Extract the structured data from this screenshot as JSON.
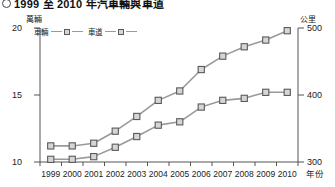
{
  "title": {
    "bullet": "circle-bullet",
    "text": "1999 至 2010 年汽車輛與車道"
  },
  "axes": {
    "left_unit": "萬輛",
    "right_unit": "公里",
    "x_title": "年份",
    "left_ticks": [
      "20",
      "15",
      "10"
    ],
    "right_ticks": [
      "500",
      "400",
      "300"
    ],
    "left_range": [
      10,
      20
    ],
    "right_range": [
      300,
      500
    ]
  },
  "legend": {
    "series1_label": "車輛",
    "series2_label": "車道"
  },
  "colors": {
    "line": "#9a9a9a",
    "marker_fill": "#d6d6d6",
    "marker_stroke": "#5a5a5a",
    "axis": "#555555",
    "text": "#222222"
  },
  "chart_data": {
    "type": "line",
    "title": "1999 至 2010 年汽車輛與車道",
    "xlabel": "年份",
    "ylabel": "萬輛",
    "y2label": "公里",
    "ylim": [
      10,
      20
    ],
    "y2lim": [
      300,
      500
    ],
    "grid": false,
    "legend_position": "top-left",
    "categories": [
      "1999",
      "2000",
      "2001",
      "2002",
      "2003",
      "2004",
      "2005",
      "2006",
      "2007",
      "2008",
      "2009",
      "2010"
    ],
    "series": [
      {
        "name": "車輛",
        "axis": "left",
        "unit": "萬輛",
        "values": [
          11.2,
          11.2,
          11.4,
          12.3,
          13.4,
          14.6,
          15.3,
          16.9,
          17.9,
          18.6,
          19.1,
          19.8
        ]
      },
      {
        "name": "車道",
        "axis": "right",
        "unit": "公里",
        "values": [
          304,
          304,
          308,
          322,
          338,
          355,
          360,
          382,
          392,
          395,
          404,
          404
        ]
      }
    ]
  }
}
